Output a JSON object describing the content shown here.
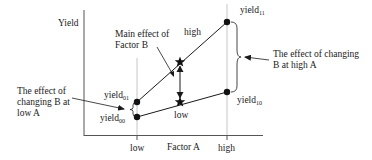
{
  "axes": {
    "y_label": "Yield",
    "x_label": "Factor A",
    "x_ticks": [
      "low",
      "high"
    ]
  },
  "lines": {
    "high_label": "high",
    "low_label": "low"
  },
  "points": {
    "yield01": {
      "base": "yield",
      "sub": "01"
    },
    "yield00": {
      "base": "yield",
      "sub": "00"
    },
    "yield11": {
      "base": "yield",
      "sub": "11"
    },
    "yield10": {
      "base": "yield",
      "sub": "10"
    }
  },
  "annotations": {
    "main_effect_line1": "Main effect of",
    "main_effect_line2": "Factor B",
    "low_a_line1": "The effect of",
    "low_a_line2": "changing B at",
    "low_a_line3": "low A",
    "high_a_line1": "The effect of changing",
    "high_a_line2": "B at high A"
  },
  "colors": {
    "ink": "#1a1a1a",
    "guide": "#b0b0b0",
    "background": "#ffffff"
  }
}
